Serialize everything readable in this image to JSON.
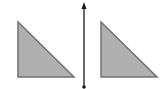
{
  "diagram": {
    "type": "reflection-across-line",
    "background": "#ffffff",
    "triangle_fill": "#b0b0b0",
    "triangle_stroke": "#707070",
    "line_color": "#1a1a1a",
    "shapes": [
      {
        "name": "left-triangle",
        "kind": "right-triangle",
        "points": [
          [
            18,
            22
          ],
          [
            18,
            77
          ],
          [
            74,
            77
          ]
        ]
      },
      {
        "name": "right-triangle",
        "kind": "right-triangle",
        "points": [
          [
            101,
            22
          ],
          [
            101,
            77
          ],
          [
            157,
            77
          ]
        ]
      }
    ],
    "axis": {
      "x": 84,
      "y_top": 4,
      "y_bottom": 87,
      "top_marker": "arrowhead",
      "bottom_marker": "dot"
    }
  }
}
